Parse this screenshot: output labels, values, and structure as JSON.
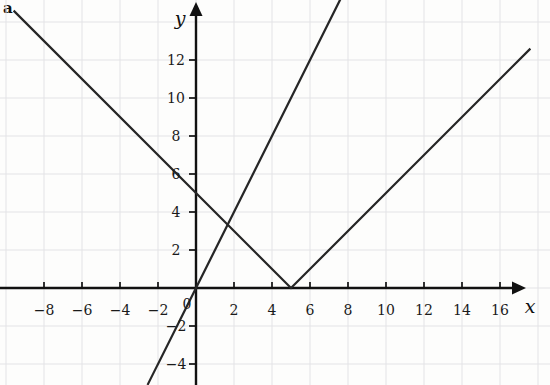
{
  "figure": {
    "panel_label": "a",
    "background_color": "#fdfdfc",
    "grid_color": "#e3e3e6",
    "axis_color": "#111111",
    "curve_color": "#262626"
  },
  "chart_data": {
    "type": "line",
    "title": "",
    "subtitle": "",
    "xlabel": "x",
    "ylabel": "y",
    "xlim": [
      -9.6,
      17.6
    ],
    "ylim": [
      -5.1,
      15.2
    ],
    "grid": true,
    "grid_spacing": 2,
    "legend": "none",
    "axis_arrows": [
      "x-positive",
      "y-positive"
    ],
    "origin_label": "0",
    "xticks": [
      -8,
      -6,
      -4,
      -2,
      2,
      4,
      6,
      8,
      10,
      12,
      14,
      16
    ],
    "xtick_labels": [
      "-8",
      "-6",
      "-4",
      "-2",
      "2",
      "4",
      "6",
      "8",
      "10",
      "12",
      "14",
      "16"
    ],
    "yticks": [
      -4,
      -2,
      2,
      4,
      6,
      8,
      10,
      12
    ],
    "ytick_labels": [
      "-4",
      "-2",
      "2",
      "4",
      "6",
      "8",
      "10",
      "12"
    ],
    "series": [
      {
        "name": "y = |x - 5|",
        "kind": "absolute-value",
        "vertex": [
          5,
          0
        ],
        "slope_left": -1,
        "slope_right": 1,
        "points": [
          [
            -9.6,
            14.6
          ],
          [
            5,
            0
          ],
          [
            17.6,
            12.6
          ]
        ],
        "color": "#262626"
      },
      {
        "name": "y = 2x",
        "kind": "linear",
        "slope": 2,
        "intercept": 0,
        "points": [
          [
            -2.55,
            -5.1
          ],
          [
            0,
            0
          ],
          [
            7.6,
            15.2
          ]
        ],
        "color": "#262626"
      }
    ],
    "intersections": [
      [
        1.667,
        3.333
      ],
      [
        5,
        10
      ]
    ]
  }
}
